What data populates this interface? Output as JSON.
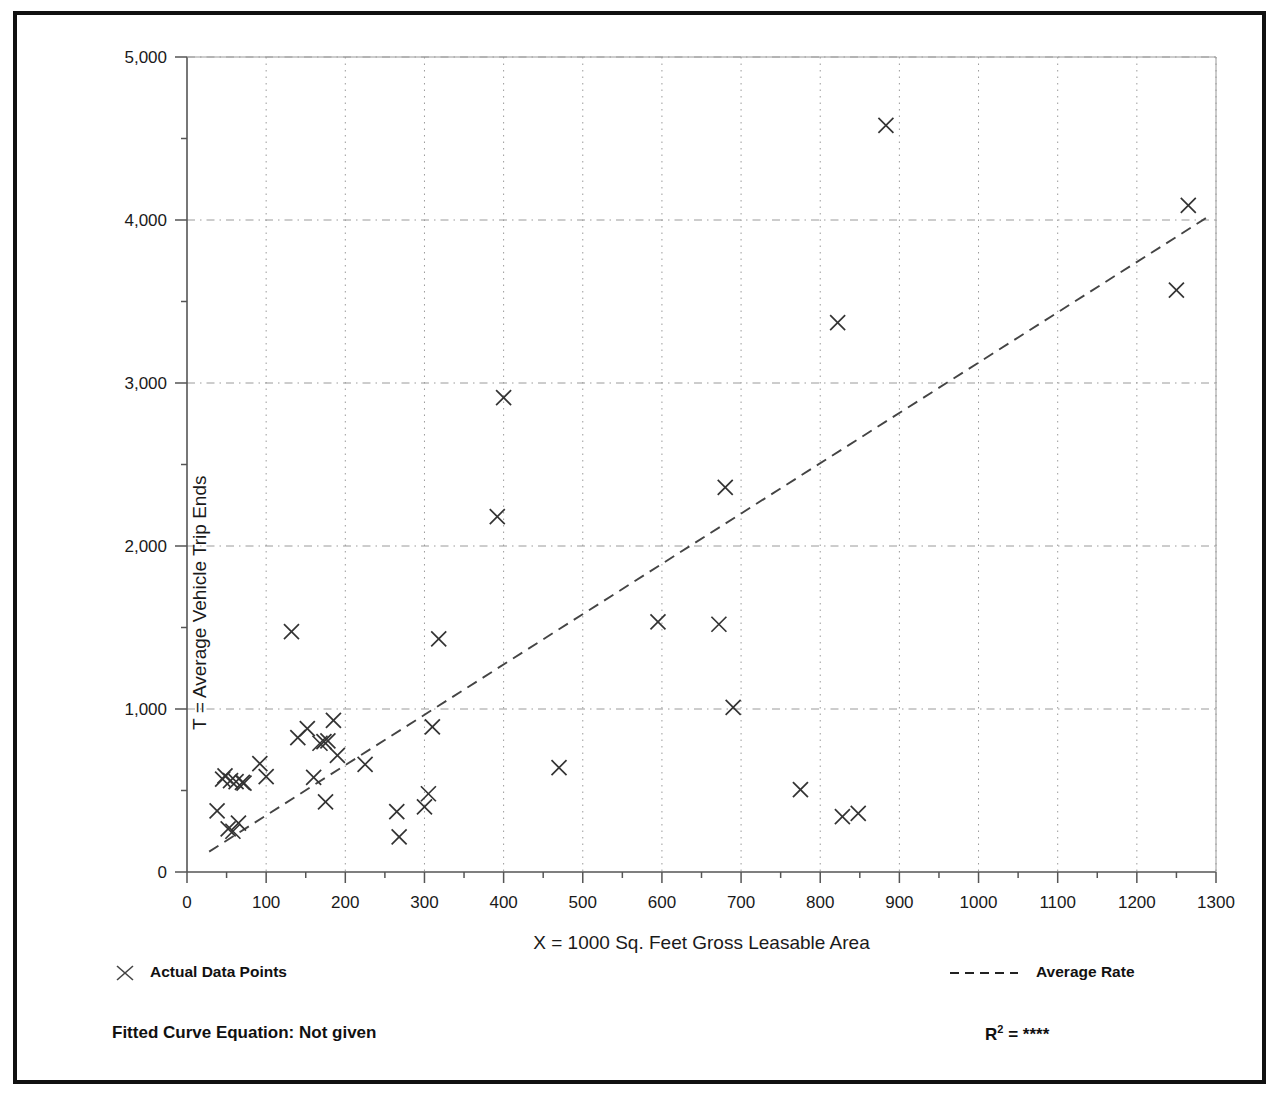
{
  "chart_data": {
    "type": "scatter",
    "title": "",
    "xlabel": "X = 1000 Sq. Feet Gross Leasable Area",
    "ylabel": "T = Average Vehicle Trip Ends",
    "xlim": [
      0,
      1300
    ],
    "ylim": [
      0,
      5000
    ],
    "xticks": [
      0,
      100,
      200,
      300,
      400,
      500,
      600,
      700,
      800,
      900,
      1000,
      1100,
      1200,
      1300
    ],
    "xtick_labels": [
      "0",
      "100",
      "200",
      "300",
      "400",
      "500",
      "600",
      "700",
      "800",
      "900",
      "1000",
      "1100",
      "1200",
      "1300"
    ],
    "xtick_minor_step": 50,
    "yticks": [
      0,
      1000,
      2000,
      3000,
      4000,
      5000
    ],
    "ytick_labels": [
      "0",
      "1,000",
      "2,000",
      "3,000",
      "4,000",
      "5,000"
    ],
    "ytick_minor_step": 500,
    "grid": true,
    "grid_style": "dotted",
    "legend_position": "below-plot",
    "series": [
      {
        "name": "Actual Data Points",
        "marker": "x",
        "color": "#333333",
        "points": [
          [
            38,
            375
          ],
          [
            45,
            570
          ],
          [
            48,
            590
          ],
          [
            52,
            265
          ],
          [
            55,
            560
          ],
          [
            58,
            250
          ],
          [
            62,
            555
          ],
          [
            65,
            300
          ],
          [
            70,
            550
          ],
          [
            72,
            545
          ],
          [
            92,
            665
          ],
          [
            100,
            585
          ],
          [
            132,
            1475
          ],
          [
            140,
            825
          ],
          [
            152,
            880
          ],
          [
            160,
            580
          ],
          [
            168,
            790
          ],
          [
            173,
            800
          ],
          [
            178,
            805
          ],
          [
            185,
            930
          ],
          [
            190,
            715
          ],
          [
            175,
            430
          ],
          [
            225,
            660
          ],
          [
            265,
            370
          ],
          [
            268,
            215
          ],
          [
            300,
            400
          ],
          [
            305,
            480
          ],
          [
            310,
            890
          ],
          [
            318,
            1430
          ],
          [
            392,
            2180
          ],
          [
            400,
            2910
          ],
          [
            470,
            640
          ],
          [
            595,
            1535
          ],
          [
            672,
            1520
          ],
          [
            680,
            2360
          ],
          [
            690,
            1010
          ],
          [
            775,
            505
          ],
          [
            822,
            3370
          ],
          [
            828,
            340
          ],
          [
            848,
            360
          ],
          [
            883,
            4580
          ],
          [
            1250,
            3570
          ],
          [
            1265,
            4090
          ]
        ]
      }
    ],
    "trendline": {
      "name": "Average Rate",
      "style": "dashed",
      "color": "#444444",
      "start": [
        28,
        125
      ],
      "end": [
        1290,
        4020
      ]
    }
  },
  "legend": {
    "data_points_label": "Actual Data Points",
    "average_rate_label": "Average Rate",
    "marker_icon": "x-marker-icon",
    "line_icon": "dashed-line-icon"
  },
  "footer": {
    "equation_label": "Fitted Curve Equation:  Not given",
    "r_squared_prefix": "R",
    "r_squared_exponent": "2",
    "r_squared_equals": " = ",
    "r_squared_value": "****"
  },
  "colors": {
    "frame": "#111111",
    "axis": "#555555",
    "grid": "#9a9a9a",
    "marker": "#333333",
    "text": "#111111"
  }
}
